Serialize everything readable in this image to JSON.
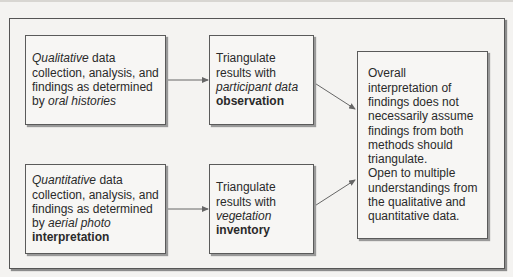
{
  "diagram": {
    "boxes": [
      {
        "id": "qualitative",
        "lines": [
          {
            "italic": "Qualitative",
            "text": " data"
          },
          {
            "text": "collection, analysis, and"
          },
          {
            "text": "findings as determined"
          },
          {
            "text": "by ",
            "italic": "oral histories"
          }
        ]
      },
      {
        "id": "triangulate-observation",
        "lines": [
          {
            "text": "Triangulate"
          },
          {
            "text": "results with"
          },
          {
            "italic": "participant data"
          },
          {
            "bold": "observation"
          }
        ]
      },
      {
        "id": "quantitative",
        "lines": [
          {
            "italic": "Quantitative",
            "text": " data"
          },
          {
            "text": "collection, analysis, and"
          },
          {
            "text": "findings as determined"
          },
          {
            "text": "by ",
            "italic": "aerial photo"
          },
          {
            "bold": "interpretation"
          }
        ]
      },
      {
        "id": "triangulate-inventory",
        "lines": [
          {
            "text": "Triangulate"
          },
          {
            "text": "results with"
          },
          {
            "italic": "vegetation"
          },
          {
            "bold": "inventory"
          }
        ]
      },
      {
        "id": "overall-interpretation",
        "lines": [
          {
            "text": "Overall"
          },
          {
            "text": "interpretation of"
          },
          {
            "text": "findings does not"
          },
          {
            "text": "necessarily assume"
          },
          {
            "text": "findings from both"
          },
          {
            "text": "methods should"
          },
          {
            "text": "triangulate."
          },
          {
            "text": "Open to multiple"
          },
          {
            "text": "understandings from"
          },
          {
            "text": "the qualitative and"
          },
          {
            "text": "quantitative data."
          }
        ]
      }
    ],
    "arrows": [
      {
        "from": "qualitative",
        "to": "triangulate-observation"
      },
      {
        "from": "quantitative",
        "to": "triangulate-inventory"
      },
      {
        "from": "triangulate-observation",
        "to": "overall-interpretation"
      },
      {
        "from": "triangulate-inventory",
        "to": "overall-interpretation"
      }
    ],
    "colors": {
      "background": "#f4f3f1",
      "border": "#555555",
      "text": "#2a2a2a",
      "arrow": "#666666"
    }
  }
}
